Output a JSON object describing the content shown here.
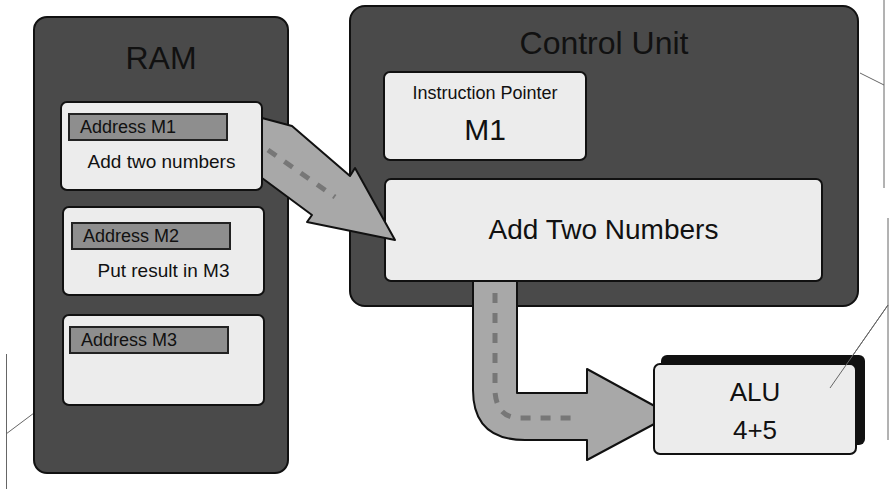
{
  "ram": {
    "title": "RAM",
    "cells": [
      {
        "address": "Address M1",
        "content": "Add two numbers"
      },
      {
        "address": "Address M2",
        "content": "Put result in M3"
      },
      {
        "address": "Address M3",
        "content": ""
      }
    ]
  },
  "control_unit": {
    "title": "Control Unit",
    "instruction_pointer": {
      "label": "Instruction Pointer",
      "value": "M1"
    },
    "current_instruction": "Add Two Numbers"
  },
  "alu": {
    "label": "ALU",
    "operation": "4+5"
  },
  "arrows": [
    {
      "from": "ram.cells.0",
      "to": "control_unit.current_instruction",
      "style": "dashed-gray"
    },
    {
      "from": "control_unit.current_instruction",
      "to": "alu",
      "style": "dashed-gray-elbow"
    }
  ],
  "colors": {
    "panel": "#4a4a4a",
    "cell": "#ececec",
    "address_bar": "#8e8e8e",
    "arrow": "#a8a8a8",
    "outline": "#111111"
  }
}
